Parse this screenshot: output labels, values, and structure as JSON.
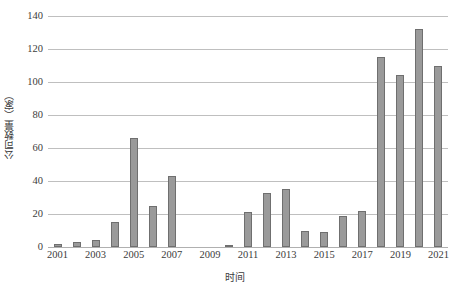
{
  "chart_data": {
    "type": "bar",
    "title": "",
    "xlabel": "时间",
    "ylabel": "公司数量（家）",
    "categories": [
      "2001",
      "2002",
      "2003",
      "2004",
      "2005",
      "2006",
      "2007",
      "2008",
      "2009",
      "2010",
      "2011",
      "2012",
      "2013",
      "2014",
      "2015",
      "2016",
      "2017",
      "2018",
      "2019",
      "2020",
      "2021"
    ],
    "values": [
      2,
      3,
      4,
      15,
      66,
      25,
      43,
      0,
      0,
      1,
      21,
      33,
      35,
      10,
      9,
      19,
      22,
      115,
      104,
      132,
      110
    ],
    "ylim": [
      0,
      140
    ],
    "ytick_values": [
      0,
      20,
      40,
      60,
      80,
      100,
      120,
      140
    ],
    "ytick_labels": [
      "0",
      "20",
      "40",
      "60",
      "80",
      "100",
      "120",
      "140"
    ],
    "xtick_labels": [
      "2001",
      "2003",
      "2005",
      "2007",
      "2009",
      "2011",
      "2013",
      "2015",
      "2017",
      "2019",
      "2021"
    ],
    "xtick_categories": [
      "2001",
      "2003",
      "2005",
      "2007",
      "2009",
      "2011",
      "2013",
      "2015",
      "2017",
      "2019",
      "2021"
    ],
    "grid": true,
    "grid_axis": "y",
    "legend": false,
    "legend_position": "none",
    "bar_color": "#9a9a9a",
    "bar_border_color": "#6f6f6f",
    "gridline_color": "#bfbfbf",
    "text_color": "#3c3c3c",
    "background_color": "#ffffff",
    "series": [
      {
        "name": "公司数量",
        "values": [
          2,
          3,
          4,
          15,
          66,
          25,
          43,
          0,
          0,
          1,
          21,
          33,
          35,
          10,
          9,
          19,
          22,
          115,
          104,
          132,
          110
        ]
      }
    ]
  }
}
